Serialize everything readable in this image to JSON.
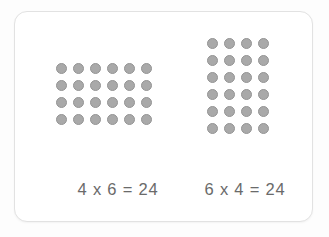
{
  "card": {
    "background_color": "#ffffff",
    "border_color": "#e2e2e2"
  },
  "colors": {
    "dot_fill": "#a9a9a9",
    "dot_stroke": "#949494",
    "text": "#6a6a6a",
    "page_background": "#fdfdfd"
  },
  "arrays": [
    {
      "id": "left",
      "name": "four-by-six-array",
      "rows": 4,
      "columns": 6,
      "total_dots": 24,
      "equation": "4 x 6 = 24",
      "factor_a": 4,
      "factor_b": 6,
      "product": 24
    },
    {
      "id": "right",
      "name": "six-by-four-array",
      "rows": 6,
      "columns": 4,
      "total_dots": 24,
      "equation": "6 x 4 = 24",
      "factor_a": 6,
      "factor_b": 4,
      "product": 24
    }
  ],
  "chart_data": {
    "type": "table",
    "title": "",
    "series": [
      {
        "name": "4 x 6 = 24",
        "rows": 4,
        "columns": 6,
        "values": 24
      },
      {
        "name": "6 x 4 = 24",
        "rows": 6,
        "columns": 4,
        "values": 24
      }
    ]
  }
}
